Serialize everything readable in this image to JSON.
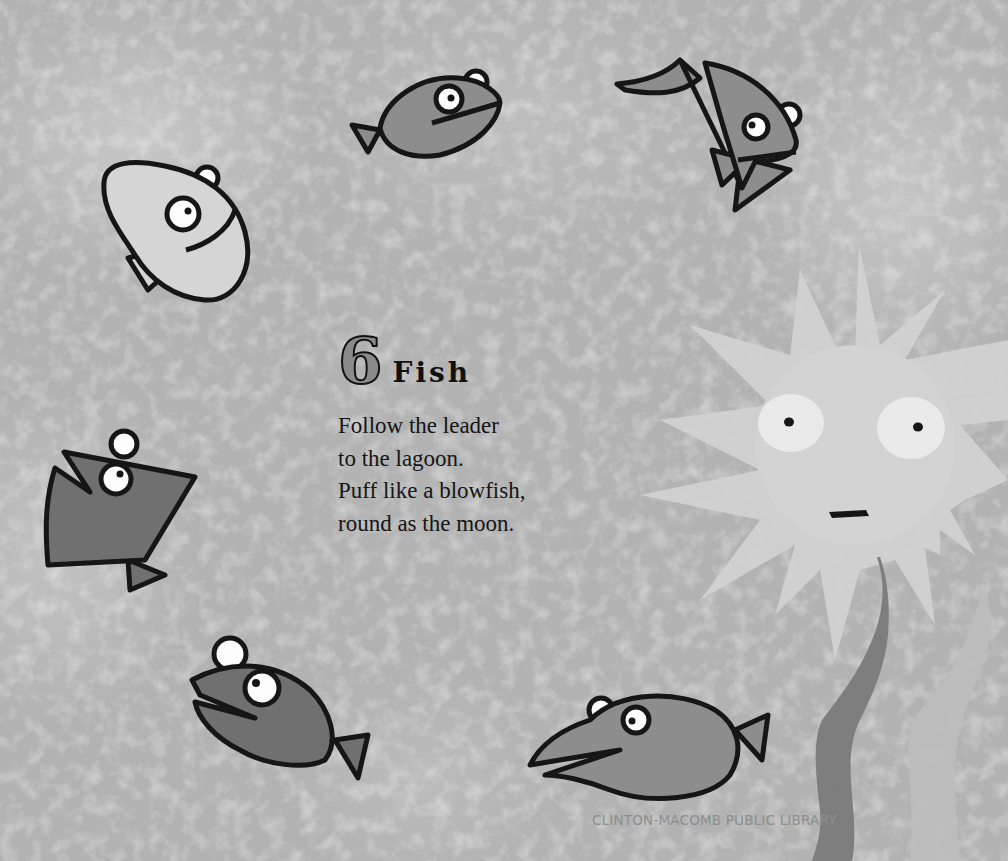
{
  "page": {
    "number": "6",
    "title": "Fish",
    "verse": [
      "Follow the leader",
      "to the lagoon.",
      "Puff like a blowfish,",
      "round as the moon."
    ],
    "watermark": "CLINTON-MACOMB PUBLIC LIBRARY"
  },
  "illustration": {
    "palette": {
      "background": "#b2b2b2",
      "outline": "#111111",
      "fish_light": "#d6d6d6",
      "fish_mid": "#8c8c8c",
      "fish_dark": "#6e6e6e",
      "blowfish": "#d2d2d2",
      "seaweed_dark": "#7c7c7c",
      "seaweed_light": "#bdbdbd"
    },
    "elements": [
      "light-bean-fish",
      "dark-round-fish-top",
      "flag-tail-fish",
      "triangle-fish-left",
      "dark-fish-bottom-left",
      "long-snout-fish-bottom",
      "spiky-blowfish",
      "dark-seaweed",
      "light-seaweed"
    ]
  }
}
